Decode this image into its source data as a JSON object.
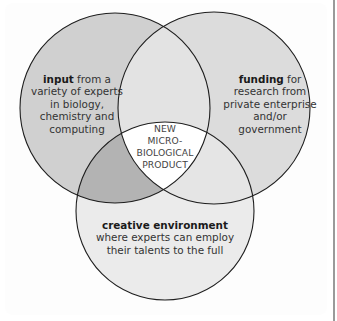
{
  "diagram": {
    "type": "venn",
    "circles": [
      {
        "id": "input",
        "title": "input",
        "text": " from a",
        "lines": [
          "variety of experts",
          "in biology,",
          "chemistry and",
          "computing"
        ],
        "fill": "#d0d0d0"
      },
      {
        "id": "funding",
        "title": "funding",
        "text": " for",
        "lines": [
          "research from",
          "private enterprise",
          "and/or",
          "government"
        ],
        "fill": "#dcdcdc"
      },
      {
        "id": "creative-environment",
        "title": "creative environment",
        "text": "",
        "lines": [
          "where experts can employ",
          "their talents to the full"
        ],
        "fill": "#ebebeb"
      }
    ],
    "center": {
      "lines": [
        "NEW",
        "MICRO-",
        "BIOLOGICAL",
        "PRODUCT"
      ],
      "fill": "#ffffff"
    },
    "overlap_colors": {
      "input_funding": "#e3e3e3",
      "input_creative": "#b3b3b3",
      "funding_creative": "#e5e5e5"
    },
    "stroke": "#1e1e1e"
  }
}
